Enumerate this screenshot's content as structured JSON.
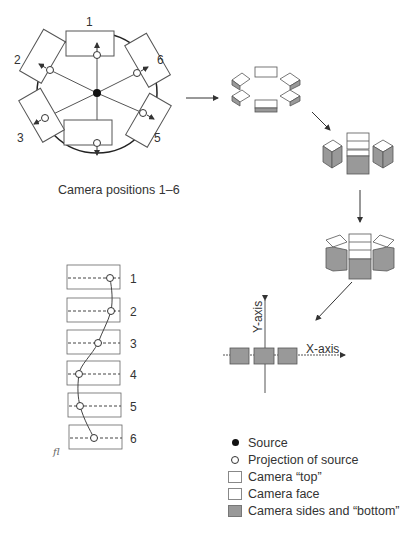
{
  "diagram": {
    "top_left": {
      "camera_labels": [
        "1",
        "2",
        "3",
        "4",
        "5",
        "6"
      ],
      "caption": "Camera positions 1–6"
    },
    "projection_strip": {
      "row_labels": [
        "1",
        "2",
        "3",
        "4",
        "5",
        "6"
      ],
      "initials": "fl"
    },
    "axes": {
      "x_label": "X-axis",
      "y_label": "Y-axis"
    },
    "legend": {
      "items": [
        {
          "symbol": "filled-dot",
          "label": "Source"
        },
        {
          "symbol": "open-circle",
          "label": "Projection of source"
        },
        {
          "symbol": "white-box",
          "label": "Camera “top”"
        },
        {
          "symbol": "white-box",
          "label": "Camera face"
        },
        {
          "symbol": "gray-box",
          "label": "Camera sides and “bottom”"
        }
      ]
    },
    "colors": {
      "line": "#444444",
      "camera_gray": "#9a9a9a",
      "camera_white": "#ffffff",
      "source": "#111111"
    }
  }
}
